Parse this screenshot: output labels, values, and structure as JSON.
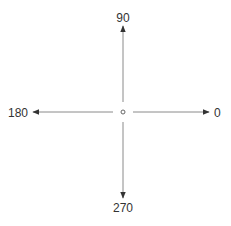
{
  "diagram": {
    "title": "",
    "center_marker": "small-circle",
    "axes": [
      {
        "direction": "right",
        "label": "0",
        "angle_deg": 0
      },
      {
        "direction": "up",
        "label": "90",
        "angle_deg": 90
      },
      {
        "direction": "left",
        "label": "180",
        "angle_deg": 180
      },
      {
        "direction": "down",
        "label": "270",
        "angle_deg": 270
      }
    ],
    "colors": {
      "line": "#8a8a8a",
      "arrowhead": "#333333",
      "text": "#333333",
      "center": "#666666"
    }
  }
}
